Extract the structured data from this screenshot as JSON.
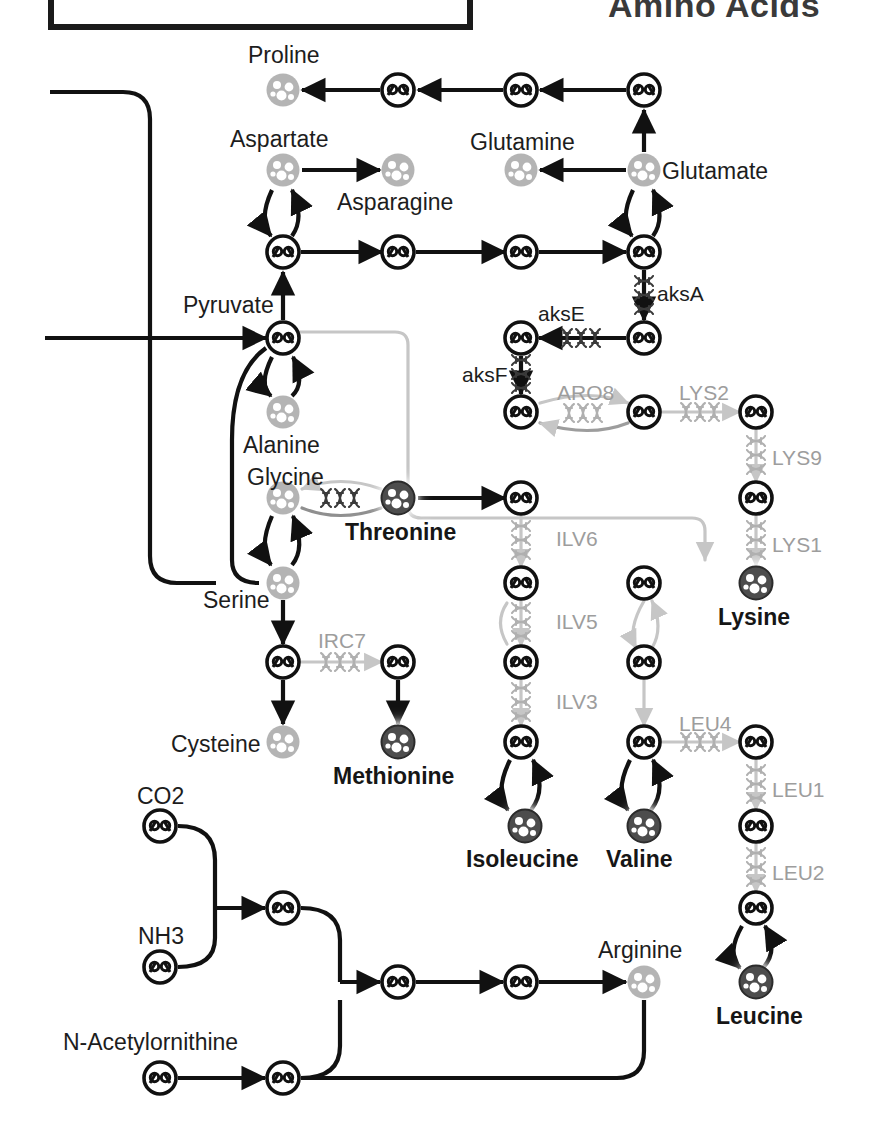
{
  "figure": {
    "title": "Amino Acids",
    "type": "metabolic-pathway-diagram"
  },
  "metabolites": [
    {
      "id": "proline",
      "label": "Proline",
      "x": 283,
      "y": 90,
      "style": "light",
      "label_x": 248,
      "label_y": 44
    },
    {
      "id": "aspartate",
      "label": "Aspartate",
      "x": 283,
      "y": 170,
      "style": "light",
      "label_x": 230,
      "label_y": 128
    },
    {
      "id": "asparagine",
      "label": "Asparagine",
      "x": 398,
      "y": 170,
      "style": "light",
      "label_x": 337,
      "label_y": 191
    },
    {
      "id": "glutamine",
      "label": "Glutamine",
      "x": 521,
      "y": 170,
      "style": "light",
      "label_x": 470,
      "label_y": 131
    },
    {
      "id": "glutamate",
      "label": "Glutamate",
      "x": 644,
      "y": 170,
      "style": "light",
      "label_x": 662,
      "label_y": 160
    },
    {
      "id": "pyruvate",
      "label": "Pyruvate",
      "x": 283,
      "y": 338,
      "style": "ring",
      "label_x": 183,
      "label_y": 294
    },
    {
      "id": "alanine",
      "label": "Alanine",
      "x": 283,
      "y": 412,
      "style": "light",
      "label_x": 243,
      "label_y": 434
    },
    {
      "id": "glycine",
      "label": "Glycine",
      "x": 283,
      "y": 498,
      "style": "light",
      "label_x": 247,
      "label_y": 466
    },
    {
      "id": "threonine",
      "label": "Threonine",
      "x": 398,
      "y": 498,
      "style": "dark",
      "label_x": 345,
      "label_y": 521
    },
    {
      "id": "serine",
      "label": "Serine",
      "x": 283,
      "y": 583,
      "style": "light",
      "label_x": 203,
      "label_y": 589
    },
    {
      "id": "cysteine",
      "label": "Cysteine",
      "x": 283,
      "y": 742,
      "style": "light",
      "label_x": 171,
      "label_y": 733
    },
    {
      "id": "methionine",
      "label": "Methionine",
      "x": 398,
      "y": 742,
      "style": "dark",
      "label_x": 333,
      "label_y": 765
    },
    {
      "id": "lysine",
      "label": "Lysine",
      "x": 756,
      "y": 583,
      "style": "dark",
      "label_x": 718,
      "label_y": 606
    },
    {
      "id": "isoleucine",
      "label": "Isoleucine",
      "x": 525,
      "y": 826,
      "style": "dark",
      "label_x": 466,
      "label_y": 848
    },
    {
      "id": "valine",
      "label": "Valine",
      "x": 644,
      "y": 826,
      "style": "dark",
      "label_x": 606,
      "label_y": 848
    },
    {
      "id": "leucine",
      "label": "Leucine",
      "x": 756,
      "y": 982,
      "style": "dark",
      "label_x": 716,
      "label_y": 1005
    },
    {
      "id": "arginine",
      "label": "Arginine",
      "x": 644,
      "y": 982,
      "style": "light",
      "label_x": 598,
      "label_y": 939
    },
    {
      "id": "co2",
      "label": "CO2",
      "x": 160,
      "y": 826,
      "style": "ring",
      "label_x": 137,
      "label_y": 785
    },
    {
      "id": "nh3",
      "label": "NH3",
      "x": 160,
      "y": 967,
      "style": "ring",
      "label_x": 138,
      "label_y": 925
    },
    {
      "id": "nacetylornithine",
      "label": "N-Acetylornithine",
      "x": 160,
      "y": 1078,
      "style": "ring",
      "label_x": 63,
      "label_y": 1031
    }
  ],
  "intermediates": [
    {
      "id": "i-pro-1",
      "x": 398,
      "y": 90
    },
    {
      "id": "i-pro-2",
      "x": 521,
      "y": 90
    },
    {
      "id": "i-pro-3",
      "x": 644,
      "y": 90
    },
    {
      "id": "i-asp-1",
      "x": 283,
      "y": 252
    },
    {
      "id": "i-mid-2",
      "x": 398,
      "y": 252
    },
    {
      "id": "i-mid-3",
      "x": 521,
      "y": 252
    },
    {
      "id": "i-glu-1",
      "x": 644,
      "y": 252
    },
    {
      "id": "i-aks-1",
      "x": 644,
      "y": 338
    },
    {
      "id": "i-aks-2",
      "x": 521,
      "y": 338
    },
    {
      "id": "i-aks-3",
      "x": 521,
      "y": 412
    },
    {
      "id": "i-aro-1",
      "x": 644,
      "y": 412
    },
    {
      "id": "i-lys-1",
      "x": 756,
      "y": 412
    },
    {
      "id": "i-lys-2",
      "x": 756,
      "y": 498
    },
    {
      "id": "i-ilv-1",
      "x": 521,
      "y": 498
    },
    {
      "id": "i-ilv-2",
      "x": 521,
      "y": 583
    },
    {
      "id": "i-ilv-3",
      "x": 521,
      "y": 662
    },
    {
      "id": "i-ilv-4",
      "x": 521,
      "y": 742
    },
    {
      "id": "i-val-1",
      "x": 644,
      "y": 583
    },
    {
      "id": "i-val-2",
      "x": 644,
      "y": 662
    },
    {
      "id": "i-val-3",
      "x": 644,
      "y": 742
    },
    {
      "id": "i-leu-1",
      "x": 756,
      "y": 742
    },
    {
      "id": "i-leu-2",
      "x": 756,
      "y": 826
    },
    {
      "id": "i-leu-3",
      "x": 756,
      "y": 908
    },
    {
      "id": "i-cys-1",
      "x": 283,
      "y": 662
    },
    {
      "id": "i-met-1",
      "x": 398,
      "y": 662
    },
    {
      "id": "i-arg-1",
      "x": 283,
      "y": 908
    },
    {
      "id": "i-arg-2",
      "x": 283,
      "y": 1078
    },
    {
      "id": "i-arg-3",
      "x": 398,
      "y": 982
    },
    {
      "id": "i-arg-4",
      "x": 521,
      "y": 982
    }
  ],
  "enzymes": [
    {
      "id": "aksA",
      "label": "aksA",
      "tone": "dark",
      "label_x": 657,
      "label_y": 283
    },
    {
      "id": "aksE",
      "label": "aksE",
      "tone": "dark",
      "label_x": 538,
      "label_y": 303
    },
    {
      "id": "aksF",
      "label": "aksF",
      "tone": "dark",
      "label_x": 462,
      "label_y": 364
    },
    {
      "id": "ARO8",
      "label": "ARO8",
      "tone": "grey",
      "label_x": 557,
      "label_y": 382
    },
    {
      "id": "LYS2",
      "label": "LYS2",
      "tone": "grey",
      "label_x": 679,
      "label_y": 382
    },
    {
      "id": "LYS9",
      "label": "LYS9",
      "tone": "grey",
      "label_x": 772,
      "label_y": 447
    },
    {
      "id": "LYS1",
      "label": "LYS1",
      "tone": "grey",
      "label_x": 772,
      "label_y": 534
    },
    {
      "id": "ILV6",
      "label": "ILV6",
      "tone": "grey",
      "label_x": 556,
      "label_y": 528
    },
    {
      "id": "ILV5",
      "label": "ILV5",
      "tone": "grey",
      "label_x": 556,
      "label_y": 611
    },
    {
      "id": "ILV3",
      "label": "ILV3",
      "tone": "grey",
      "label_x": 556,
      "label_y": 691
    },
    {
      "id": "IRC7",
      "label": "IRC7",
      "tone": "grey",
      "label_x": 318,
      "label_y": 630
    },
    {
      "id": "LEU4",
      "label": "LEU4",
      "tone": "grey",
      "label_x": 679,
      "label_y": 713
    },
    {
      "id": "LEU1",
      "label": "LEU1",
      "tone": "grey",
      "label_x": 772,
      "label_y": 779
    },
    {
      "id": "LEU2",
      "label": "LEU2",
      "tone": "grey",
      "label_x": 772,
      "label_y": 862
    }
  ],
  "colors": {
    "node_light": "#b4b4b4",
    "node_dark": "#4d4d4d",
    "node_ring": "#111111",
    "edge_dark": "#111111",
    "edge_grey": "#c6c6c6",
    "enzyme_grey": "#9d9d9d",
    "text": "#1d1d1d",
    "title": "#3a3a3a"
  },
  "topbox": {
    "x": 48,
    "y": -60,
    "w": 425,
    "h": 90
  }
}
